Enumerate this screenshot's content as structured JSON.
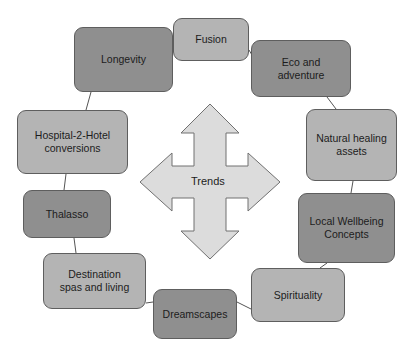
{
  "diagram": {
    "center": {
      "label": "Trends",
      "shape": "four-way-arrow",
      "fill": "#dcdcdc",
      "stroke": "#707070"
    },
    "colors": {
      "dark_node": "#8f8f8f",
      "light_node": "#b4b4b4",
      "border": "#5e5e5e",
      "connector": "#555555"
    },
    "nodes": [
      {
        "id": "fusion",
        "label": "Fusion",
        "tone": "light"
      },
      {
        "id": "eco",
        "label": "Eco and\nadventure",
        "tone": "dark"
      },
      {
        "id": "natural",
        "label": "Natural healing\nassets",
        "tone": "light"
      },
      {
        "id": "local",
        "label": "Local Wellbeing\nConcepts",
        "tone": "dark"
      },
      {
        "id": "spirituality",
        "label": "Spirituality",
        "tone": "light"
      },
      {
        "id": "dreamscapes",
        "label": "Dreamscapes",
        "tone": "dark"
      },
      {
        "id": "destination",
        "label": "Destination\nspas and living",
        "tone": "light"
      },
      {
        "id": "thalasso",
        "label": "Thalasso",
        "tone": "dark"
      },
      {
        "id": "hospital",
        "label": "Hospital-2-Hotel\nconversions",
        "tone": "light"
      },
      {
        "id": "longevity",
        "label": "Longevity",
        "tone": "dark"
      }
    ]
  }
}
